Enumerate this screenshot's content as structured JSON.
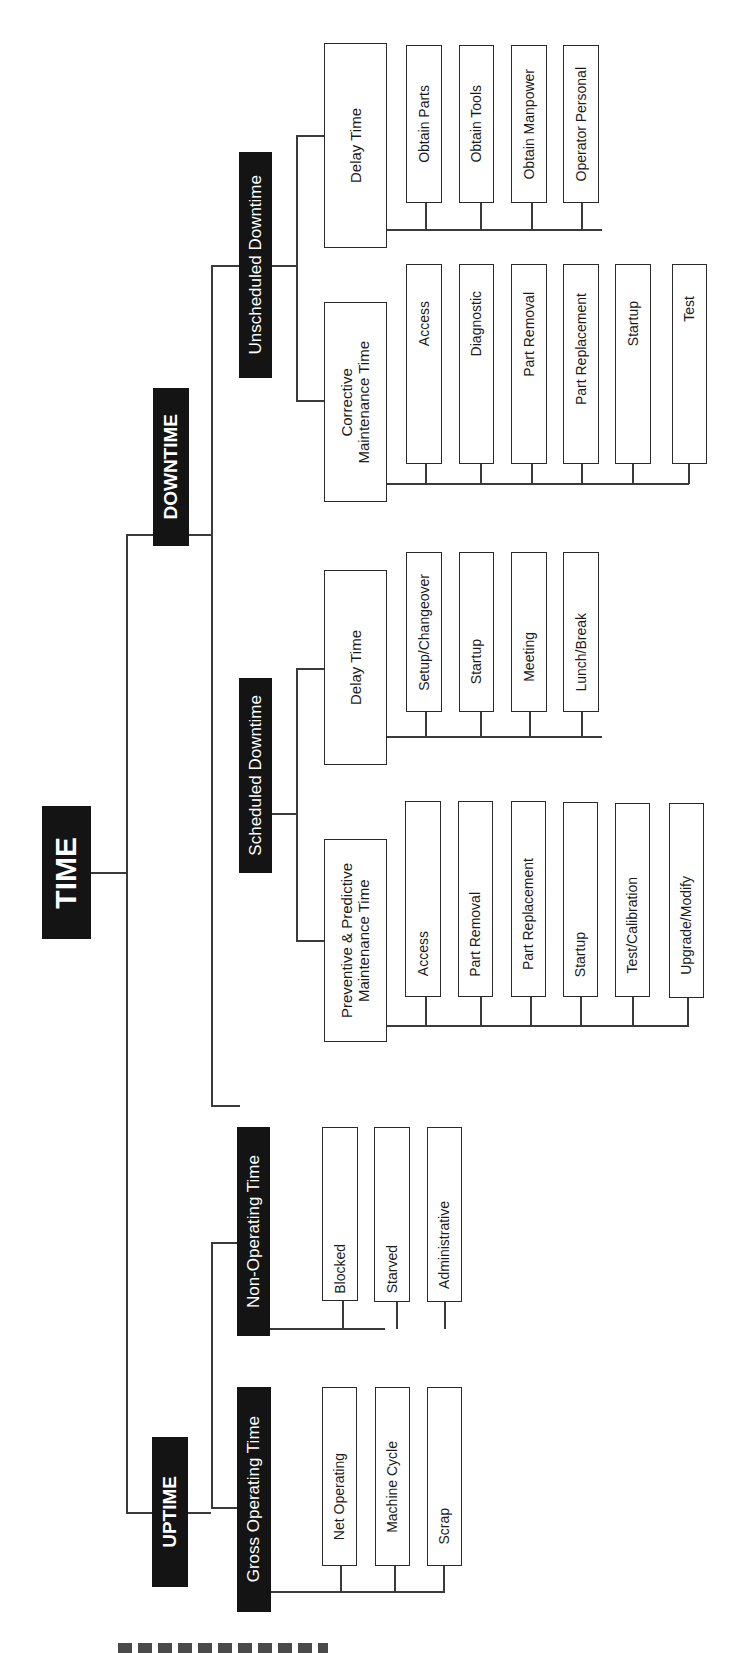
{
  "diagram": {
    "root": {
      "label": "TIME"
    },
    "level1": {
      "downtime": {
        "label": "DOWNTIME"
      },
      "uptime": {
        "label": "UPTIME"
      }
    },
    "level2": {
      "unscheduled_downtime": {
        "label": "Unscheduled Downtime"
      },
      "scheduled_downtime": {
        "label": "Scheduled Downtime"
      },
      "non_operating_time": {
        "label": "Non-Operating Time"
      },
      "gross_operating_time": {
        "label": "Gross Operating Time"
      }
    },
    "level3": {
      "unsched_delay_time": {
        "label": "Delay Time"
      },
      "corrective_maintenance_time": {
        "label": "Corrective\nMaintenance Time"
      },
      "sched_delay_time": {
        "label": "Delay Time"
      },
      "preventive_predictive_maintenance_time": {
        "label": "Preventive & Predictive\nMaintenance Time"
      }
    },
    "leaves": {
      "unsched_delay": [
        "Obtain Parts",
        "Obtain Tools",
        "Obtain Manpower",
        "Operator Personal"
      ],
      "corrective": [
        "Access",
        "Diagnostic",
        "Part Removal",
        "Part Replacement",
        "Startup",
        "Test"
      ],
      "sched_delay": [
        "Setup/Changeover",
        "Startup",
        "Meeting",
        "Lunch/Break"
      ],
      "preventive": [
        "Access",
        "Part Removal",
        "Part Replacement",
        "Startup",
        "Test/Calibration",
        "Upgrade/Modify"
      ],
      "non_operating": [
        "Blocked",
        "Starved",
        "Administrative"
      ],
      "gross_operating": [
        "Net Operating",
        "Machine Cycle",
        "Scrap"
      ]
    }
  },
  "colors": {
    "dark_box": "#141414",
    "line": "#3a3a3a",
    "background": "#ffffff"
  }
}
